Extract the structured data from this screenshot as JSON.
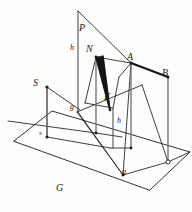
{
  "figure": {
    "kind": "geometric-perspective-diagram",
    "background_color": "#fdfdfc",
    "stroke_color": "#1c1c1c",
    "accent_fill": "#151515"
  },
  "labels": {
    "plane_p": "P",
    "plane_s": "S",
    "plane_g": "G",
    "point_n": "N",
    "point_f": "F",
    "point_a": "A",
    "point_b": "B",
    "trace_h_upper": "h",
    "trace_h_lower": "h",
    "trace_g_upper": "g",
    "trace_g_lower": "g",
    "trace_s": "s"
  },
  "geometry": {
    "ground_plane": [
      [
        14,
        141
      ],
      [
        52,
        111
      ],
      [
        190,
        152
      ],
      [
        150,
        190
      ]
    ],
    "vertical_plane_right": [
      [
        78,
        11
      ],
      [
        132,
        62
      ],
      [
        171,
        152
      ],
      [
        119,
        168
      ]
    ],
    "vertical_plane_left": [
      [
        46,
        87
      ],
      [
        79,
        61
      ],
      [
        100,
        112
      ],
      [
        63,
        138
      ]
    ],
    "points": {
      "N": [
        96,
        57
      ],
      "F": [
        110,
        110
      ],
      "A": [
        131,
        63
      ],
      "B": [
        168,
        77
      ],
      "S": [
        47,
        87
      ],
      "s_low": [
        47,
        137
      ],
      "g_node": [
        77,
        112
      ],
      "g_base": [
        123,
        175
      ],
      "open_circle": [
        168,
        162
      ]
    },
    "shaded_triangle": [
      [
        96,
        57
      ],
      [
        110,
        110
      ],
      [
        101,
        56
      ]
    ],
    "thick_segment_ab": [
      [
        131,
        63
      ],
      [
        168,
        77
      ]
    ]
  },
  "label_positions": {
    "plane_p": {
      "x": 79,
      "y": 23
    },
    "trace_h_upper": {
      "x": 71,
      "y": 45
    },
    "point_n": {
      "x": 86,
      "y": 44
    },
    "point_a": {
      "x": 128,
      "y": 54
    },
    "point_b": {
      "x": 163,
      "y": 70
    },
    "plane_s": {
      "x": 34,
      "y": 79
    },
    "point_f": {
      "x": 105,
      "y": 93
    },
    "trace_g_upper": {
      "x": 71,
      "y": 104
    },
    "trace_h_lower": {
      "x": 118,
      "y": 118
    },
    "trace_s": {
      "x": 39,
      "y": 130
    },
    "trace_g_upper2": {
      "x": 0,
      "y": 0
    },
    "trace_g_lower": {
      "x": 122,
      "y": 168
    },
    "plane_g": {
      "x": 57,
      "y": 184
    }
  }
}
